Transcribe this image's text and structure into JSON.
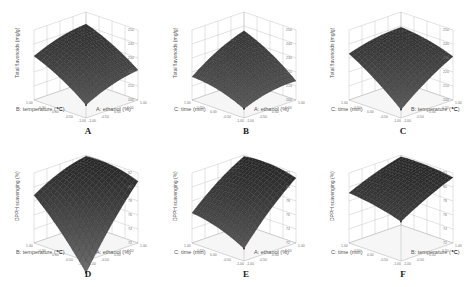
{
  "figure": {
    "panels": [
      {
        "id": "A",
        "zlabel": "Total flavonoids (mg/g)",
        "xlabel": "B: temperature (℃)",
        "ylabel": "A: ethanol (%)",
        "zticks": [
          "200",
          "210",
          "220",
          "230",
          "240",
          "250"
        ],
        "xticks": [
          "1.00",
          "0.50",
          "0.00",
          "-0.50",
          "-1.00"
        ],
        "yticks": [
          "1.00",
          "0.50",
          "0.00",
          "-0.50",
          "-1.00"
        ]
      },
      {
        "id": "B",
        "zlabel": "Total flavonoids (mg/g)",
        "xlabel": "C: time (min)",
        "ylabel": "A: ethanol (%)",
        "zticks": [
          "200",
          "210",
          "220",
          "230",
          "240",
          "250"
        ],
        "xticks": [
          "1.00",
          "0.50",
          "0.00",
          "-0.50",
          "-1.00"
        ],
        "yticks": [
          "1.00",
          "0.50",
          "0.00",
          "-0.50",
          "-1.00"
        ]
      },
      {
        "id": "C",
        "zlabel": "Total flavonoids (mg/g)",
        "xlabel": "C: time (min)",
        "ylabel": "B: temperature (℃)",
        "zticks": [
          "200",
          "210",
          "220",
          "230",
          "240",
          "250"
        ],
        "xticks": [
          "1.00",
          "0.50",
          "0.00",
          "-0.50",
          "-1.00"
        ],
        "yticks": [
          "1.00",
          "0.50",
          "0.00",
          "-0.50",
          "-1.00"
        ]
      },
      {
        "id": "D",
        "zlabel": "DPPH scavenging (%)",
        "xlabel": "B: temperature (℃)",
        "ylabel": "A: ethanol (%)",
        "zticks": [
          "72",
          "74",
          "76",
          "78",
          "80",
          "82"
        ],
        "xticks": [
          "1.00",
          "0.50",
          "0.00",
          "-0.50",
          "-1.00"
        ],
        "yticks": [
          "1.00",
          "0.50",
          "0.00",
          "-0.50",
          "-1.00"
        ]
      },
      {
        "id": "E",
        "zlabel": "DPPH scavenging (%)",
        "xlabel": "C: time (min)",
        "ylabel": "A: ethanol (%)",
        "zticks": [
          "72",
          "74",
          "76",
          "78",
          "80",
          "82"
        ],
        "xticks": [
          "1.00",
          "0.50",
          "0.00",
          "-0.50",
          "-1.00"
        ],
        "yticks": [
          "1.00",
          "0.50",
          "0.00",
          "-0.50",
          "-1.00"
        ]
      },
      {
        "id": "F",
        "zlabel": "DPPH scavenging (%)",
        "xlabel": "C: time (min)",
        "ylabel": "B: temperature (℃)",
        "zticks": [
          "72",
          "74",
          "76",
          "78",
          "80",
          "82"
        ],
        "xticks": [
          "1.00",
          "0.50",
          "0.00",
          "-0.50",
          "-1.00"
        ],
        "yticks": [
          "1.00",
          "0.50",
          "0.00",
          "-0.50",
          "-1.00"
        ]
      }
    ]
  },
  "chart_data": [
    {
      "type": "surface",
      "panel": "A",
      "title": "",
      "zlabel": "Total flavonoids (mg/g)",
      "xlabel": "B: temperature (℃)",
      "ylabel": "A: ethanol (%)",
      "xrange": [
        -1,
        1
      ],
      "yrange": [
        -1,
        1
      ],
      "zlim": [
        200,
        250
      ],
      "corners": {
        "left": 230,
        "back": 240,
        "right": 220,
        "front": 208
      },
      "peak": 242
    },
    {
      "type": "surface",
      "panel": "B",
      "title": "",
      "zlabel": "Total flavonoids (mg/g)",
      "xlabel": "C: time (min)",
      "ylabel": "A: ethanol (%)",
      "xrange": [
        -1,
        1
      ],
      "yrange": [
        -1,
        1
      ],
      "zlim": [
        200,
        250
      ],
      "corners": {
        "left": 215,
        "back": 235,
        "right": 212,
        "front": 205
      },
      "peak": 237
    },
    {
      "type": "surface",
      "panel": "C",
      "title": "",
      "zlabel": "Total flavonoids (mg/g)",
      "xlabel": "C: time (min)",
      "ylabel": "B: temperature (℃)",
      "xrange": [
        -1,
        1
      ],
      "yrange": [
        -1,
        1
      ],
      "zlim": [
        200,
        250
      ],
      "corners": {
        "left": 232,
        "back": 238,
        "right": 230,
        "front": 205
      },
      "peak": 240
    },
    {
      "type": "surface",
      "panel": "D",
      "title": "",
      "zlabel": "DPPH scavenging (%)",
      "xlabel": "B: temperature (℃)",
      "ylabel": "A: ethanol (%)",
      "xrange": [
        -1,
        1
      ],
      "yrange": [
        -1,
        1
      ],
      "zlim": [
        72,
        82
      ],
      "corners": {
        "left": 78.5,
        "back": 81.5,
        "right": 80.5,
        "front": 70
      },
      "peak": 81.8
    },
    {
      "type": "surface",
      "panel": "E",
      "title": "",
      "zlabel": "DPPH scavenging (%)",
      "xlabel": "C: time (min)",
      "ylabel": "A: ethanol (%)",
      "xrange": [
        -1,
        1
      ],
      "yrange": [
        -1,
        1
      ],
      "zlim": [
        72,
        82
      ],
      "corners": {
        "left": 76,
        "back": 81.5,
        "right": 81,
        "front": 73.5
      },
      "peak": 81.8
    },
    {
      "type": "surface",
      "panel": "F",
      "title": "",
      "zlabel": "DPPH scavenging (%)",
      "xlabel": "C: time (min)",
      "ylabel": "B: temperature (℃)",
      "xrange": [
        -1,
        1
      ],
      "yrange": [
        -1,
        1
      ],
      "zlim": [
        72,
        82
      ],
      "corners": {
        "left": 79,
        "back": 81.6,
        "right": 81.2,
        "front": 77.5
      },
      "peak": 81.8
    }
  ]
}
